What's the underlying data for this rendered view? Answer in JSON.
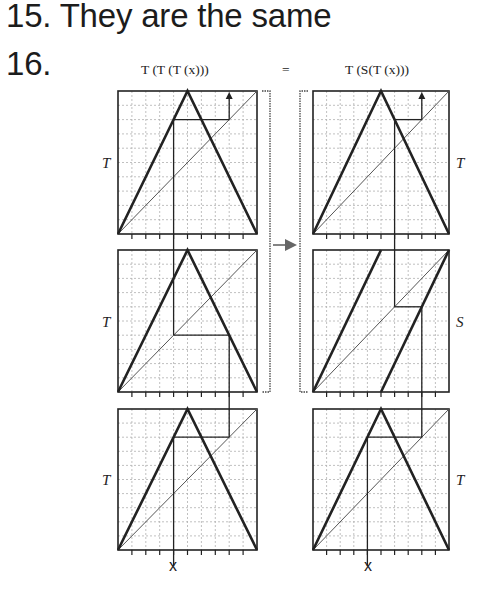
{
  "answers": [
    {
      "number": "15.",
      "text": "They are the same"
    },
    {
      "number": "16.",
      "text": ""
    }
  ],
  "figure": {
    "left_formula": "T (T (T (x)))",
    "equals": "=",
    "right_formula": "T (S(T (x)))",
    "left_column_labels": [
      "T",
      "T",
      "T"
    ],
    "right_column_labels": [
      "T",
      "S",
      "T"
    ],
    "x_label_left": "x",
    "x_label_right": "x",
    "grid_divisions": 10,
    "colors": {
      "ink": "#222222",
      "grid": "#b0b0b0"
    }
  },
  "chart_data": {
    "type": "cobweb-diagram",
    "x0": 0.4,
    "maps": {
      "T": "tent map: T(x)=2x for x<=0.5, 2-2x for x>0.5",
      "S": "doubling map: S(x)=2x mod 1"
    },
    "left_column": {
      "panels_top_to_bottom": [
        "T",
        "T",
        "T"
      ],
      "orbit": [
        0.4,
        0.8,
        0.4,
        0.8
      ]
    },
    "right_column": {
      "panels_top_to_bottom": [
        "T",
        "S",
        "T"
      ],
      "orbit": [
        0.4,
        0.8,
        0.6,
        0.8
      ]
    },
    "xlim": [
      0,
      1
    ],
    "ylim": [
      0,
      1
    ],
    "grid": true
  }
}
